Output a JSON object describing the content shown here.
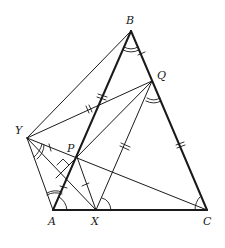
{
  "diagram": {
    "points": {
      "B": {
        "label": "B",
        "x": 131,
        "y": 31
      },
      "Q": {
        "label": "Q",
        "x": 152,
        "y": 81
      },
      "Y": {
        "label": "Y",
        "x": 27,
        "y": 138
      },
      "P": {
        "label": "P",
        "x": 77,
        "y": 157
      },
      "A": {
        "label": "A",
        "x": 53,
        "y": 210
      },
      "X": {
        "label": "X",
        "x": 96,
        "y": 210
      },
      "C": {
        "label": "C",
        "x": 207,
        "y": 210
      }
    },
    "labels": [
      "A",
      "B",
      "C",
      "P",
      "Q",
      "X",
      "Y"
    ],
    "stroke_color": "#1a1a1a"
  }
}
